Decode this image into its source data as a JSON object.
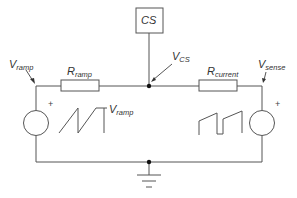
{
  "diagram": {
    "type": "circuit-schematic",
    "colors": {
      "wire": "#555555",
      "text": "#333333",
      "background": "#ffffff"
    },
    "cs_box": {
      "label": "CS"
    },
    "labels": {
      "v_ramp_top": {
        "main": "V",
        "sub": "ramp"
      },
      "r_ramp": {
        "main": "R",
        "sub": "ramp"
      },
      "v_cs": {
        "main": "V",
        "sub": "CS"
      },
      "r_current": {
        "main": "R",
        "sub": "current"
      },
      "v_sense": {
        "main": "V",
        "sub": "sense"
      },
      "v_ramp_wave": {
        "main": "V",
        "sub": "ramp"
      }
    },
    "sources": [
      {
        "name": "left-source",
        "polarity": "+",
        "waveform": "sawtooth-ramp"
      },
      {
        "name": "right-source",
        "polarity": "+",
        "waveform": "sense-ramp-pulses"
      }
    ],
    "ground": {
      "symbol": "ground"
    }
  }
}
